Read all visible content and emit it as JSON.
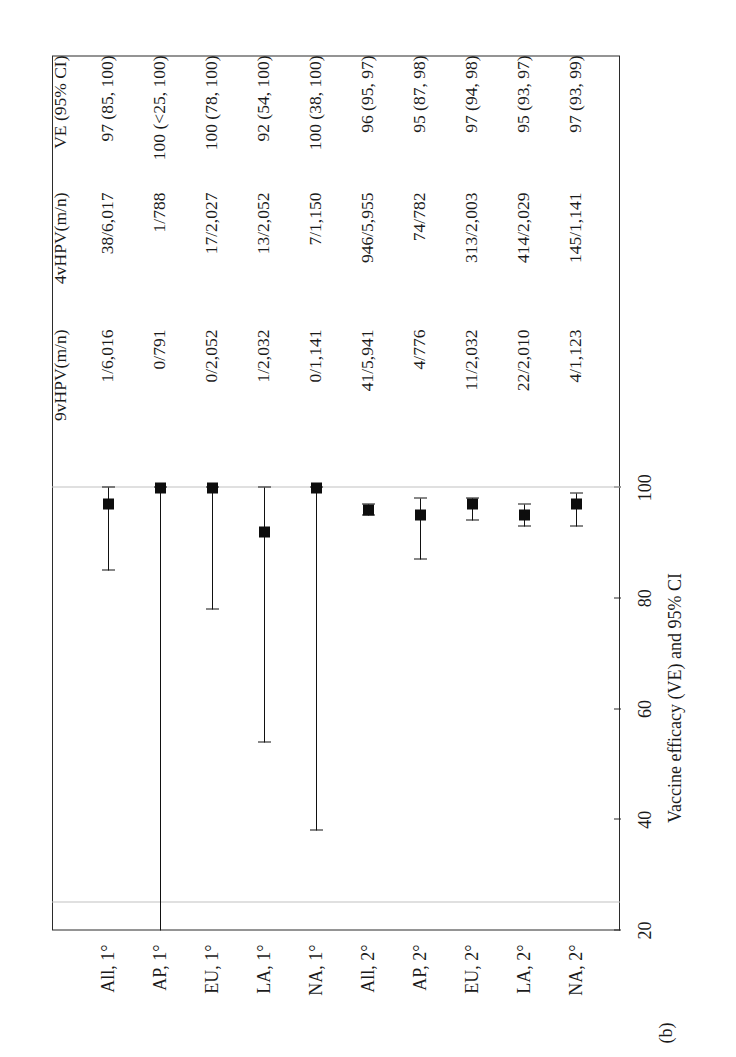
{
  "figure": {
    "panel_label": "(b)",
    "axis_title": "Vaccine efficacy (VE) and 95% CI"
  },
  "table": {
    "headers": {
      "col1": "9vHPV(m/n)",
      "col2": "4vHPV(m/n)",
      "col3": "VE (95% CI)"
    }
  },
  "chart_data": {
    "type": "scatter",
    "title": "",
    "xlabel": "Vaccine efficacy (VE) and 95% CI",
    "ylabel": "",
    "xlim": [
      20,
      104
    ],
    "xticks": [
      20,
      40,
      60,
      80,
      100
    ],
    "xticklabels": [
      "20",
      "40",
      "60",
      "80",
      "100"
    ],
    "grid": false,
    "reference_lines": [
      25,
      100
    ],
    "orientation": "rotated-90-ccw",
    "categories": [
      "All, 1°",
      "AP, 1°",
      "EU, 1°",
      "LA, 1°",
      "NA, 1°",
      "All, 2°",
      "AP, 2°",
      "EU, 2°",
      "LA, 2°",
      "NA, 2°"
    ],
    "rows": [
      {
        "category": "All, 1°",
        "col1": "1/6,016",
        "col2": "38/6,017",
        "col3": "97 (85, 100)",
        "ve": 97,
        "ci_low": 85,
        "ci_high": 100,
        "ci_low_truncated": false
      },
      {
        "category": "AP, 1°",
        "col1": "0/791",
        "col2": "1/788",
        "col3": "100 (<25, 100)",
        "ve": 100,
        "ci_low": 20,
        "ci_high": 100,
        "ci_low_truncated": true
      },
      {
        "category": "EU, 1°",
        "col1": "0/2,052",
        "col2": "17/2,027",
        "col3": "100 (78, 100)",
        "ve": 100,
        "ci_low": 78,
        "ci_high": 100,
        "ci_low_truncated": false
      },
      {
        "category": "LA, 1°",
        "col1": "1/2,032",
        "col2": "13/2,052",
        "col3": "92 (54, 100)",
        "ve": 92,
        "ci_low": 54,
        "ci_high": 100,
        "ci_low_truncated": false
      },
      {
        "category": "NA, 1°",
        "col1": "0/1,141",
        "col2": "7/1,150",
        "col3": "100 (38, 100)",
        "ve": 100,
        "ci_low": 38,
        "ci_high": 100,
        "ci_low_truncated": false
      },
      {
        "category": "All, 2°",
        "col1": "41/5,941",
        "col2": "946/5,955",
        "col3": "96 (95, 97)",
        "ve": 96,
        "ci_low": 95,
        "ci_high": 97,
        "ci_low_truncated": false
      },
      {
        "category": "AP, 2°",
        "col1": "4/776",
        "col2": "74/782",
        "col3": "95 (87, 98)",
        "ve": 95,
        "ci_low": 87,
        "ci_high": 98,
        "ci_low_truncated": false
      },
      {
        "category": "EU, 2°",
        "col1": "11/2,032",
        "col2": "313/2,003",
        "col3": "97 (94, 98)",
        "ve": 97,
        "ci_low": 94,
        "ci_high": 98,
        "ci_low_truncated": false
      },
      {
        "category": "LA, 2°",
        "col1": "22/2,010",
        "col2": "414/2,029",
        "col3": "95 (93, 97)",
        "ve": 95,
        "ci_low": 93,
        "ci_high": 97,
        "ci_low_truncated": false
      },
      {
        "category": "NA, 2°",
        "col1": "4/1,123",
        "col2": "145/1,141",
        "col3": "97 (93, 99)",
        "ve": 97,
        "ci_low": 93,
        "ci_high": 99,
        "ci_low_truncated": false
      }
    ]
  }
}
